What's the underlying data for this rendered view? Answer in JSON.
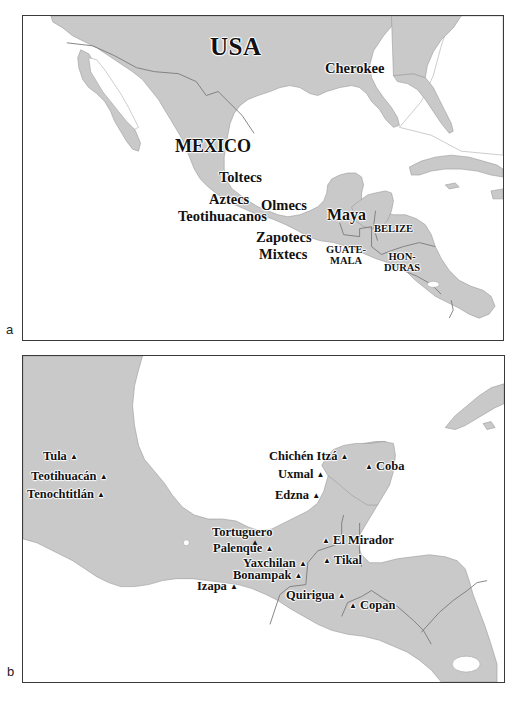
{
  "colors": {
    "land": "#c9c9c9",
    "water": "#ffffff",
    "border": "#7a7a7a",
    "frame": "#3a3a3a",
    "text": "#111111"
  },
  "panels": {
    "a": {
      "letter": "a",
      "countries": {
        "usa": "USA",
        "mexico": "MEXICO",
        "belize": "BELIZE",
        "guatemala_1": "GUATE-",
        "guatemala_2": "MALA",
        "honduras_1": "HON-",
        "honduras_2": "DURAS"
      },
      "cultures": {
        "cherokee": "Cherokee",
        "toltecs": "Toltecs",
        "aztecs": "Aztecs",
        "olmecs": "Olmecs",
        "teotihuacanos": "Teotihuacanos",
        "maya": "Maya",
        "zapotecs": "Zapotecs",
        "mixtecs": "Mixtecs"
      }
    },
    "b": {
      "letter": "b",
      "site_marker": "▲",
      "sites": {
        "tula": "Tula",
        "teotihuacan": "Teotihuacán",
        "tenochtitlan": "Tenochtitlán",
        "chichen_itza": "Chichén Itzá",
        "coba": "Coba",
        "uxmal": "Uxmal",
        "edzna": "Edzna",
        "tortuguero": "Tortuguero",
        "palenque": "Palenque",
        "el_mirador": "El Mirador",
        "yaxchilan": "Yaxchilan",
        "tikal": "Tikal",
        "bonampak": "Bonampak",
        "izapa": "Izapa",
        "quirigua": "Quirigua",
        "copan": "Copan"
      }
    }
  }
}
